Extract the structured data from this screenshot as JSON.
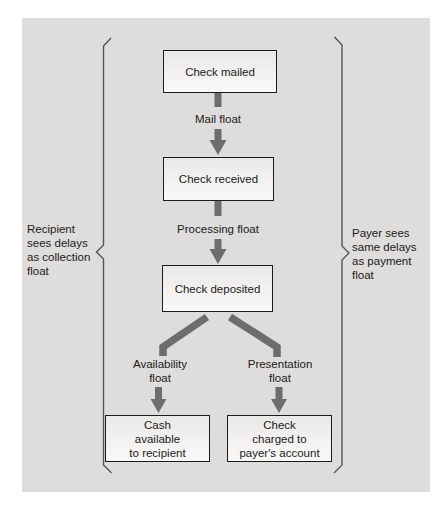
{
  "nodes": {
    "check_mailed": "Check mailed",
    "check_received": "Check received",
    "check_deposited": "Check deposited",
    "cash_available": "Cash\navailable\nto recipient",
    "check_charged": "Check\ncharged to\npayer's account"
  },
  "float_labels": {
    "mail": "Mail float",
    "processing": "Processing float",
    "availability": "Availability\nfloat",
    "presentation": "Presentation\nfloat"
  },
  "side_labels": {
    "left": "Recipient\nsees delays\nas collection\nfloat",
    "right": "Payer sees\nsame delays\nas payment\nfloat"
  },
  "colors": {
    "arrow": "#6e6c6c",
    "bracket": "#555555",
    "panel_background": "#dedddb",
    "box_border": "#1c1c1c",
    "text": "#1a1a1a"
  }
}
